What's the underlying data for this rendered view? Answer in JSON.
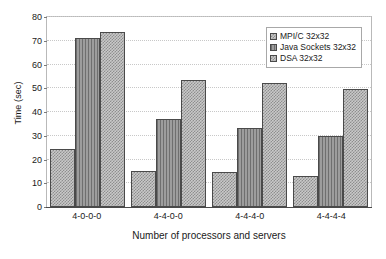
{
  "chart_data": {
    "type": "bar",
    "title": "",
    "xlabel": "Number of processors and servers",
    "ylabel": "Time (sec)",
    "categories": [
      "4-0-0-0",
      "4-4-0-0",
      "4-4-4-0",
      "4-4-4-4"
    ],
    "series": [
      {
        "name": "MPI/C 32x32",
        "values": [
          24,
          15,
          14.5,
          13
        ]
      },
      {
        "name": "Java Sockets 32x32",
        "values": [
          70.5,
          36.5,
          33,
          29.5
        ]
      },
      {
        "name": "DSA 32x32",
        "values": [
          73,
          53,
          51.5,
          49
        ]
      }
    ],
    "ylim": [
      0,
      80
    ],
    "yticks": [
      0,
      10,
      20,
      30,
      40,
      50,
      60,
      70,
      80
    ],
    "ytick_labels": [
      "0",
      "10",
      "20",
      "30",
      "40",
      "50",
      "60",
      "70",
      "80"
    ],
    "grid": true,
    "legend_position": "top-right"
  },
  "legend": {
    "items": [
      {
        "label": "MPI/C 32x32",
        "pattern": "checker"
      },
      {
        "label": "Java Sockets 32x32",
        "pattern": "vertical-lines"
      },
      {
        "label": "DSA 32x32",
        "pattern": "checker"
      }
    ]
  },
  "colors": {
    "series_light": "#c9c9c9",
    "series_dark": "#8a8a8a",
    "axis": "#4a4a4a",
    "grid": "#c8c8c8",
    "text": "#1a1a1a"
  }
}
